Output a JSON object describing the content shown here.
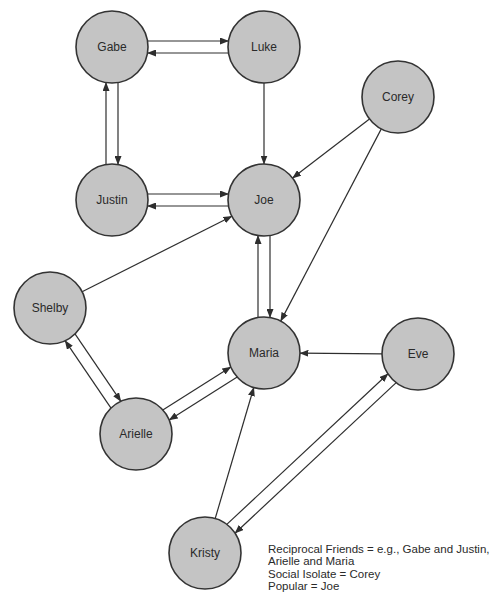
{
  "diagram": {
    "node_radius": 36,
    "colors": {
      "node_fill": "#c4c4c4",
      "node_stroke": "#333333",
      "edge": "#2e2e2e",
      "text": "#2a2a2a",
      "background": "#ffffff"
    },
    "nodes": [
      {
        "id": "gabe",
        "label": "Gabe",
        "x": 112,
        "y": 47
      },
      {
        "id": "luke",
        "label": "Luke",
        "x": 264,
        "y": 47
      },
      {
        "id": "corey",
        "label": "Corey",
        "x": 398,
        "y": 97
      },
      {
        "id": "justin",
        "label": "Justin",
        "x": 112,
        "y": 200
      },
      {
        "id": "joe",
        "label": "Joe",
        "x": 264,
        "y": 200
      },
      {
        "id": "shelby",
        "label": "Shelby",
        "x": 50,
        "y": 308
      },
      {
        "id": "maria",
        "label": "Maria",
        "x": 264,
        "y": 353
      },
      {
        "id": "eve",
        "label": "Eve",
        "x": 418,
        "y": 354
      },
      {
        "id": "arielle",
        "label": "Arielle",
        "x": 136,
        "y": 434
      },
      {
        "id": "kristy",
        "label": "Kristy",
        "x": 205,
        "y": 553
      }
    ],
    "edges": [
      {
        "from": "gabe",
        "to": "luke",
        "offset": -6
      },
      {
        "from": "luke",
        "to": "gabe",
        "offset": -6
      },
      {
        "from": "gabe",
        "to": "justin",
        "offset": -6
      },
      {
        "from": "justin",
        "to": "gabe",
        "offset": -6
      },
      {
        "from": "luke",
        "to": "joe",
        "offset": 0
      },
      {
        "from": "joe",
        "to": "justin",
        "offset": -6
      },
      {
        "from": "justin",
        "to": "joe",
        "offset": -6
      },
      {
        "from": "corey",
        "to": "joe",
        "offset": 0
      },
      {
        "from": "corey",
        "to": "maria",
        "offset": 0
      },
      {
        "from": "shelby",
        "to": "joe",
        "offset": 0
      },
      {
        "from": "joe",
        "to": "maria",
        "offset": -6
      },
      {
        "from": "maria",
        "to": "joe",
        "offset": -6
      },
      {
        "from": "shelby",
        "to": "arielle",
        "offset": -6
      },
      {
        "from": "arielle",
        "to": "shelby",
        "offset": -6
      },
      {
        "from": "maria",
        "to": "arielle",
        "offset": -6
      },
      {
        "from": "arielle",
        "to": "maria",
        "offset": -6
      },
      {
        "from": "eve",
        "to": "maria",
        "offset": 0
      },
      {
        "from": "kristy",
        "to": "maria",
        "offset": 0
      },
      {
        "from": "eve",
        "to": "kristy",
        "offset": -6
      },
      {
        "from": "kristy",
        "to": "eve",
        "offset": -6
      }
    ]
  },
  "legend": {
    "lines": [
      "Reciprocal Friends = e.g., Gabe and Justin,",
      "Arielle and Maria",
      "Social Isolate = Corey",
      "Popular = Joe"
    ]
  }
}
